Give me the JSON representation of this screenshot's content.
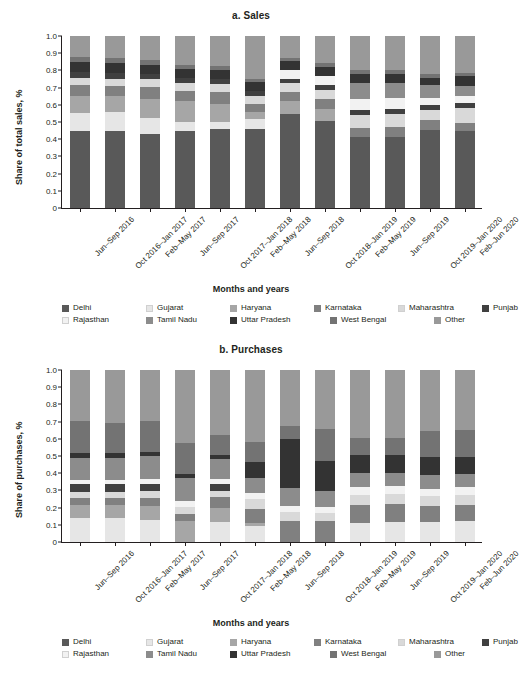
{
  "figure": {
    "xlabel": "Months and years",
    "categories": [
      "Jun–Sep 2016",
      "Oct 2016–Jan 2017",
      "Feb–May 2017",
      "Jun–Sep 2017",
      "Oct 2017–Jan 2018",
      "Feb–May 2018",
      "Jun–Sep 2018",
      "Oct 2018–Jan 2019",
      "Feb–May 2019",
      "Jun–Sep 2019",
      "Oct 2019–Jan 2020",
      "Feb–Jun 2020"
    ],
    "yticks": [
      "1.0",
      "0.9",
      "0.8",
      "0.7",
      "0.6",
      "0.5",
      "0.4",
      "0.3",
      "0.2",
      "0.1",
      "0"
    ],
    "legend": [
      {
        "label": "Delhi",
        "color": "#595959"
      },
      {
        "label": "Gujarat",
        "color": "#e6e6e6"
      },
      {
        "label": "Haryana",
        "color": "#a6a6a6"
      },
      {
        "label": "Karnataka",
        "color": "#808080"
      },
      {
        "label": "Maharashtra",
        "color": "#d9d9d9"
      },
      {
        "label": "Punjab",
        "color": "#404040"
      },
      {
        "label": "Rajasthan",
        "color": "#f2f2f2"
      },
      {
        "label": "Tamil Nadu",
        "color": "#8c8c8c"
      },
      {
        "label": "Uttar Pradesh",
        "color": "#333333"
      },
      {
        "label": "West Bengal",
        "color": "#737373"
      },
      {
        "label": "Other",
        "color": "#999999"
      }
    ]
  },
  "chart_data": [
    {
      "type": "bar",
      "id": "sales",
      "title": "a. Sales",
      "stacked": true,
      "normalized": true,
      "xlabel": "Months and years",
      "ylabel": "Share of total sales, %",
      "ylim": [
        0,
        1
      ],
      "yticks": [
        0,
        0.1,
        0.2,
        0.3,
        0.4,
        0.5,
        0.6,
        0.7,
        0.8,
        0.9,
        1.0
      ],
      "grid": false,
      "legend_position": "bottom",
      "categories": [
        "Jun–Sep 2016",
        "Oct 2016–Jan 2017",
        "Feb–May 2017",
        "Jun–Sep 2017",
        "Oct 2017–Jan 2018",
        "Feb–May 2018",
        "Jun–Sep 2018",
        "Oct 2018–Jan 2019",
        "Feb–May 2019",
        "Jun–Sep 2019",
        "Oct 2019–Jan 2020",
        "Feb–Jun 2020"
      ],
      "series": [
        {
          "name": "Delhi",
          "color": "#595959",
          "values": [
            0.45,
            0.447,
            0.433,
            0.448,
            0.458,
            0.459,
            0.549,
            0.506,
            0.412,
            0.413,
            0.455,
            0.447
          ]
        },
        {
          "name": "Gujarat",
          "color": "#e6e6e6",
          "values": [
            0.105,
            0.113,
            0.09,
            0.054,
            0.043,
            0.057,
            0.0,
            0.0,
            0.0,
            0.0,
            0.0,
            0.0
          ]
        },
        {
          "name": "Haryana",
          "color": "#a6a6a6",
          "values": [
            0.095,
            0.092,
            0.113,
            0.12,
            0.105,
            0.041,
            0.071,
            0.072,
            0.0,
            0.0,
            0.0,
            0.0
          ]
        },
        {
          "name": "Karnataka",
          "color": "#808080",
          "values": [
            0.065,
            0.06,
            0.066,
            0.057,
            0.068,
            0.047,
            0.055,
            0.056,
            0.056,
            0.06,
            0.057,
            0.05
          ]
        },
        {
          "name": "Maharashtra",
          "color": "#d9d9d9",
          "values": [
            0.042,
            0.04,
            0.049,
            0.048,
            0.048,
            0.048,
            0.051,
            0.052,
            0.071,
            0.074,
            0.06,
            0.084
          ]
        },
        {
          "name": "Punjab",
          "color": "#404040",
          "values": [
            0.035,
            0.034,
            0.029,
            0.032,
            0.031,
            0.031,
            0.027,
            0.029,
            0.03,
            0.031,
            0.025,
            0.028
          ]
        },
        {
          "name": "Rajasthan",
          "color": "#f2f2f2",
          "values": [
            0.0,
            0.0,
            0.0,
            0.0,
            0.0,
            0.0,
            0.05,
            0.055,
            0.065,
            0.06,
            0.045,
            0.04
          ]
        },
        {
          "name": "Tamil Nadu",
          "color": "#8c8c8c",
          "values": [
            0.0,
            0.0,
            0.0,
            0.0,
            0.0,
            0.0,
            0.0,
            0.0,
            0.093,
            0.09,
            0.075,
            0.06
          ]
        },
        {
          "name": "Uttar Pradesh",
          "color": "#333333",
          "values": [
            0.058,
            0.056,
            0.051,
            0.049,
            0.048,
            0.047,
            0.051,
            0.052,
            0.054,
            0.051,
            0.04,
            0.06
          ]
        },
        {
          "name": "West Bengal",
          "color": "#737373",
          "values": [
            0.03,
            0.032,
            0.027,
            0.025,
            0.026,
            0.022,
            0.02,
            0.021,
            0.022,
            0.023,
            0.02,
            0.017
          ]
        },
        {
          "name": "Other",
          "color": "#999999",
          "values": [
            0.12,
            0.126,
            0.142,
            0.167,
            0.173,
            0.248,
            0.126,
            0.157,
            0.197,
            0.198,
            0.223,
            0.214
          ]
        }
      ]
    },
    {
      "type": "bar",
      "id": "purchases",
      "title": "b. Purchases",
      "stacked": true,
      "normalized": true,
      "xlabel": "Months and years",
      "ylabel": "Share of purchases, %",
      "ylim": [
        0,
        1
      ],
      "yticks": [
        0,
        0.1,
        0.2,
        0.3,
        0.4,
        0.5,
        0.6,
        0.7,
        0.8,
        0.9,
        1.0
      ],
      "grid": false,
      "legend_position": "bottom",
      "categories": [
        "Jun–Sep 2016",
        "Oct 2016–Jan 2017",
        "Feb–May 2017",
        "Jun–Sep 2017",
        "Oct 2017–Jan 2018",
        "Feb–May 2018",
        "Jun–Sep 2018",
        "Oct 2018–Jan 2019",
        "Feb–May 2019",
        "Jun–Sep 2019",
        "Oct 2019–Jan 2020",
        "Feb–Jun 2020"
      ],
      "series": [
        {
          "name": "Delhi",
          "color": "#595959",
          "values": [
            0.0,
            0.0,
            0.0,
            0.0,
            0.0,
            0.0,
            0.0,
            0.0,
            0.0,
            0.0,
            0.0,
            0.0
          ]
        },
        {
          "name": "Gujarat",
          "color": "#e6e6e6",
          "values": [
            0.142,
            0.14,
            0.126,
            0.0,
            0.116,
            0.095,
            0.0,
            0.0,
            0.11,
            0.114,
            0.118,
            0.12
          ]
        },
        {
          "name": "Haryana",
          "color": "#a6a6a6",
          "values": [
            0.076,
            0.074,
            0.086,
            0.12,
            0.08,
            0.013,
            0.0,
            0.0,
            0.0,
            0.0,
            0.0,
            0.0
          ]
        },
        {
          "name": "Karnataka",
          "color": "#808080",
          "values": [
            0.037,
            0.043,
            0.045,
            0.043,
            0.065,
            0.085,
            0.122,
            0.123,
            0.106,
            0.107,
            0.092,
            0.094
          ]
        },
        {
          "name": "Maharashtra",
          "color": "#d9d9d9",
          "values": [
            0.037,
            0.036,
            0.042,
            0.04,
            0.038,
            0.055,
            0.055,
            0.048,
            0.06,
            0.06,
            0.058,
            0.06
          ]
        },
        {
          "name": "Punjab",
          "color": "#404040",
          "values": [
            0.046,
            0.044,
            0.038,
            0.0,
            0.037,
            0.0,
            0.0,
            0.0,
            0.0,
            0.0,
            0.0,
            0.0
          ]
        },
        {
          "name": "Rajasthan",
          "color": "#f2f2f2",
          "values": [
            0.024,
            0.025,
            0.03,
            0.037,
            0.028,
            0.035,
            0.035,
            0.035,
            0.042,
            0.042,
            0.04,
            0.044
          ]
        },
        {
          "name": "Tamil Nadu",
          "color": "#8c8c8c",
          "values": [
            0.128,
            0.127,
            0.132,
            0.133,
            0.118,
            0.09,
            0.105,
            0.09,
            0.082,
            0.08,
            0.083,
            0.08
          ]
        },
        {
          "name": "Uttar Pradesh",
          "color": "#333333",
          "values": [
            0.027,
            0.026,
            0.025,
            0.024,
            0.023,
            0.09,
            0.285,
            0.175,
            0.105,
            0.105,
            0.102,
            0.095
          ]
        },
        {
          "name": "West Bengal",
          "color": "#737373",
          "values": [
            0.185,
            0.18,
            0.178,
            0.178,
            0.115,
            0.116,
            0.075,
            0.185,
            0.1,
            0.1,
            0.155,
            0.16
          ]
        },
        {
          "name": "Other",
          "color": "#999999",
          "values": [
            0.298,
            0.305,
            0.298,
            0.425,
            0.38,
            0.421,
            0.323,
            0.344,
            0.395,
            0.392,
            0.352,
            0.347
          ]
        }
      ]
    }
  ]
}
